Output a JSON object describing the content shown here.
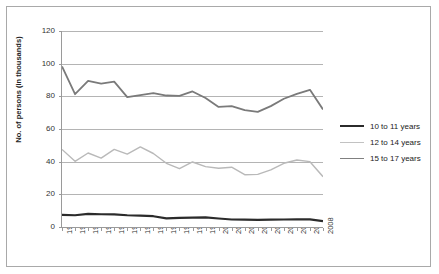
{
  "chart_data": {
    "type": "line",
    "title": "",
    "xlabel": "",
    "ylabel": "No. of persons (in thousands)",
    "ylim": [
      0,
      120
    ],
    "yticks": [
      0,
      20,
      40,
      60,
      80,
      100,
      120
    ],
    "grid": true,
    "legend_position": "right",
    "categories": [
      "1988",
      "1989",
      "1990",
      "1991",
      "1992",
      "1993",
      "1994",
      "1995",
      "1996",
      "1997",
      "1998",
      "1999",
      "2000",
      "2001",
      "2002",
      "2003",
      "2004",
      "2005",
      "2006",
      "2007",
      "2008"
    ],
    "x": [
      1988,
      1989,
      1990,
      1991,
      1992,
      1993,
      1994,
      1995,
      1996,
      1997,
      1998,
      1999,
      2000,
      2001,
      2002,
      2003,
      2004,
      2005,
      2006,
      2007,
      2008
    ],
    "series": [
      {
        "name": "10 to 11 years",
        "color": "#2b2b2b",
        "width": 2.2,
        "values": [
          7.4,
          7.2,
          8.0,
          7.8,
          7.7,
          7.2,
          7.0,
          6.6,
          5.3,
          5.6,
          5.7,
          5.9,
          5.2,
          4.6,
          4.5,
          4.4,
          4.5,
          4.6,
          4.7,
          4.7,
          3.6
        ]
      },
      {
        "name": "12 to 14 years",
        "color": "#b9b9b9",
        "width": 1.4,
        "values": [
          47.5,
          40.2,
          45.3,
          42.2,
          47.5,
          44.6,
          49.0,
          45.0,
          39.0,
          35.7,
          39.8,
          37.0,
          36.0,
          36.6,
          32.0,
          32.2,
          35.0,
          39.0,
          41.0,
          40.0,
          30.8
        ]
      },
      {
        "name": "15 to 17 years",
        "color": "#7a7a7a",
        "width": 1.8,
        "values": [
          98.3,
          81.3,
          89.5,
          87.8,
          89.0,
          79.5,
          80.8,
          82.0,
          80.5,
          80.3,
          83.0,
          79.0,
          73.5,
          74.0,
          71.5,
          70.5,
          74.0,
          78.5,
          81.5,
          84.0,
          72.0
        ]
      }
    ]
  },
  "legend": {
    "items": [
      {
        "label": "10 to 11 years",
        "color": "#2b2b2b",
        "thickness": "2.4px"
      },
      {
        "label": "12 to 14 years",
        "color": "#c2c2c2",
        "thickness": "1.4px"
      },
      {
        "label": "15 to 17 years",
        "color": "#808080",
        "thickness": "1.8px"
      }
    ]
  },
  "axis": {
    "y_title": "No. of persons (in thousands)",
    "y_ticks": [
      "0",
      "20",
      "40",
      "60",
      "80",
      "100",
      "120"
    ],
    "x_ticks": [
      "1988",
      "1989",
      "1990",
      "1991",
      "1992",
      "1993",
      "1994",
      "1995",
      "1996",
      "1997",
      "1998",
      "1999",
      "2000",
      "2001",
      "2002",
      "2003",
      "2004",
      "2005",
      "2006",
      "2007",
      "2008"
    ]
  }
}
